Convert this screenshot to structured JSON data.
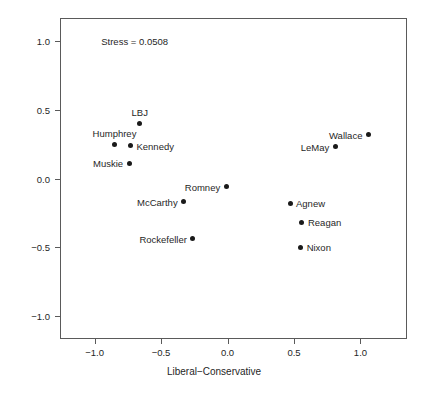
{
  "chart_data": {
    "type": "scatter",
    "title": "",
    "xlabel": "Liberal−Conservative",
    "ylabel": "Republican−Democrat",
    "xlim": [
      -1.26,
      1.35
    ],
    "ylim": [
      -1.17,
      1.17
    ],
    "xticks": [
      -1.0,
      -0.5,
      0.0,
      0.5,
      1.0
    ],
    "xticklabels": [
      "−1.0",
      "−0.5",
      "0.0",
      "0.5",
      "1.0"
    ],
    "yticks": [
      -1.0,
      -0.5,
      0.0,
      0.5,
      1.0
    ],
    "yticklabels": [
      "−1.0",
      "−0.5",
      "0.0",
      "0.5",
      "1.0"
    ],
    "grid": false,
    "legend": "none",
    "marker_color": "#1a1a1a",
    "annotations": [
      {
        "text": "Stress = 0.0508",
        "x": -0.95,
        "y": 1.0
      }
    ],
    "points": [
      {
        "label": "LBJ",
        "x": -0.66,
        "y": 0.4,
        "label_pos": "above"
      },
      {
        "label": "Humphrey",
        "x": -0.85,
        "y": 0.25,
        "label_pos": "above"
      },
      {
        "label": "Kennedy",
        "x": -0.73,
        "y": 0.24,
        "label_pos": "right"
      },
      {
        "label": "Muskie",
        "x": -0.74,
        "y": 0.11,
        "label_pos": "left"
      },
      {
        "label": "Wallace",
        "x": 1.06,
        "y": 0.32,
        "label_pos": "left"
      },
      {
        "label": "LeMay",
        "x": 0.81,
        "y": 0.23,
        "label_pos": "left"
      },
      {
        "label": "Romney",
        "x": -0.01,
        "y": -0.06,
        "label_pos": "left"
      },
      {
        "label": "McCarthy",
        "x": -0.33,
        "y": -0.17,
        "label_pos": "left"
      },
      {
        "label": "Agnew",
        "x": 0.47,
        "y": -0.18,
        "label_pos": "right"
      },
      {
        "label": "Reagan",
        "x": 0.56,
        "y": -0.32,
        "label_pos": "right"
      },
      {
        "label": "Rockefeller",
        "x": -0.26,
        "y": -0.44,
        "label_pos": "left"
      },
      {
        "label": "Nixon",
        "x": 0.55,
        "y": -0.5,
        "label_pos": "right"
      }
    ]
  }
}
